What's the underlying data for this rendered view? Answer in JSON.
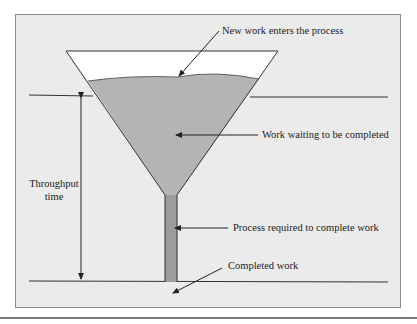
{
  "diagram": {
    "type": "funnel-process",
    "labels": {
      "new_work": "New work enters the process",
      "waiting": "Work waiting to be completed",
      "throughput_line1": "Throughput",
      "throughput_line2": "time",
      "process": "Process required to complete work",
      "completed": "Completed work"
    },
    "colors": {
      "background": "#ebebeb",
      "funnel_fill": "#b4b4b4",
      "tube_fill": "#9c9c9c",
      "empty_top": "#ffffff",
      "line": "#333333"
    }
  }
}
